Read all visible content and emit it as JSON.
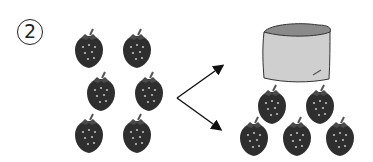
{
  "problem": {
    "number_label": "2"
  },
  "left_group": {
    "item": "strawberry",
    "count": 6,
    "positions": [
      [
        89,
        50
      ],
      [
        137,
        50
      ],
      [
        101,
        93
      ],
      [
        149,
        93
      ],
      [
        89,
        135
      ],
      [
        137,
        135
      ]
    ]
  },
  "right_group": {
    "container": "cup",
    "item": "strawberry",
    "visible_count": 5,
    "positions": [
      [
        272,
        106
      ],
      [
        320,
        106
      ],
      [
        254,
        138
      ],
      [
        297,
        138
      ],
      [
        340,
        138
      ]
    ]
  },
  "arrows": {
    "origin": [
      177,
      98
    ],
    "targets": [
      [
        224,
        65
      ],
      [
        222,
        130
      ]
    ]
  },
  "colors": {
    "strawberry": "#2e2e2e",
    "seed": "#bdbdbd",
    "cup_body": "#cfcfcf",
    "cup_top": "#8a8a8a",
    "outline": "#333333"
  }
}
